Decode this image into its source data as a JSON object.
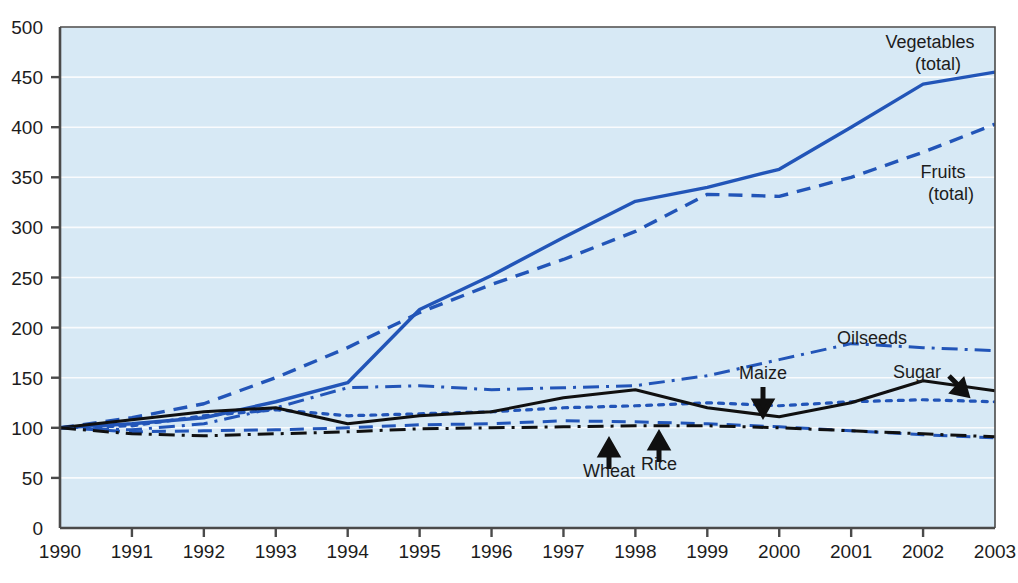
{
  "chart_data": {
    "type": "line",
    "title": "",
    "subtitle": "",
    "xlabel": "",
    "ylabel": "",
    "x": [
      1990,
      1991,
      1992,
      1993,
      1994,
      1995,
      1996,
      1997,
      1998,
      1999,
      2000,
      2001,
      2002,
      2003
    ],
    "xlim": [
      1990,
      2003
    ],
    "ylim": [
      0,
      500
    ],
    "ytick_values": [
      0,
      50,
      100,
      150,
      200,
      250,
      300,
      350,
      400,
      450,
      500
    ],
    "ytick_labels": [
      "0",
      "50",
      "100",
      "150",
      "200",
      "250",
      "300",
      "350",
      "400",
      "450",
      "500"
    ],
    "xtick_labels": [
      "1990",
      "1991",
      "1992",
      "1993",
      "1994",
      "1995",
      "1996",
      "1997",
      "1998",
      "1999",
      "2000",
      "2001",
      "2002",
      "2003"
    ],
    "grid": true,
    "grid_color": "#ffffff",
    "plot_background": "#d7e9f5",
    "legend_position": "inline-labels",
    "series": [
      {
        "name": "Vegetables (total)",
        "label": "Vegetables",
        "label_line2": "(total)",
        "style": "solid",
        "color": "#2255b8",
        "width": 3.4,
        "values": [
          100,
          104,
          110,
          126,
          145,
          218,
          252,
          290,
          326,
          340,
          358,
          400,
          443,
          455
        ]
      },
      {
        "name": "Fruits (total)",
        "label": "Fruits",
        "label_line2": "(total)",
        "style": "dashed",
        "color": "#2255b8",
        "width": 3.4,
        "values": [
          100,
          110,
          124,
          150,
          180,
          215,
          243,
          268,
          296,
          333,
          331,
          350,
          375,
          403
        ]
      },
      {
        "name": "Oilseeds",
        "label": "Oilseeds",
        "label_line2": "",
        "style": "dashdot",
        "color": "#2255b8",
        "width": 3.0,
        "values": [
          100,
          98,
          104,
          120,
          140,
          142,
          138,
          140,
          142,
          152,
          168,
          184,
          180,
          177
        ]
      },
      {
        "name": "Maize",
        "label": "Maize",
        "label_line2": "",
        "style": "dotted",
        "color": "#2255b8",
        "width": 3.2,
        "values": [
          100,
          102,
          112,
          118,
          112,
          114,
          116,
          120,
          122,
          125,
          122,
          126,
          128,
          126
        ]
      },
      {
        "name": "Sugar",
        "label": "Sugar",
        "label_line2": "",
        "style": "solid",
        "color": "#101010",
        "width": 3.0,
        "values": [
          100,
          108,
          116,
          120,
          104,
          112,
          116,
          130,
          138,
          120,
          111,
          125,
          147,
          137
        ]
      },
      {
        "name": "Wheat",
        "label": "Wheat",
        "label_line2": "",
        "style": "dashed",
        "color": "#2255b8",
        "width": 3.0,
        "values": [
          100,
          96,
          97,
          98,
          100,
          103,
          104,
          107,
          106,
          104,
          101,
          97,
          93,
          90
        ]
      },
      {
        "name": "Rice",
        "label": "Rice",
        "label_line2": "",
        "style": "dashdot",
        "color": "#101010",
        "width": 3.0,
        "values": [
          100,
          94,
          92,
          94,
          96,
          99,
          100,
          101,
          102,
          102,
          100,
          97,
          94,
          91
        ]
      }
    ],
    "annotations": [
      {
        "text": "Vegetables",
        "text2": "(total)",
        "x": 930,
        "y": 48,
        "anchor": "middle",
        "arrow": "none"
      },
      {
        "text": "Fruits",
        "text2": "(total)",
        "x": 943,
        "y": 178,
        "anchor": "middle",
        "arrow": "none"
      },
      {
        "text": "Oilseeds",
        "text2": "",
        "x": 872,
        "y": 344,
        "anchor": "middle",
        "arrow": "none"
      },
      {
        "text": "Sugar",
        "text2": "",
        "x": 917,
        "y": 378,
        "anchor": "middle",
        "arrow": "down-right"
      },
      {
        "text": "Maize",
        "text2": "",
        "x": 763,
        "y": 379,
        "anchor": "middle",
        "arrow": "down"
      },
      {
        "text": "Wheat",
        "text2": "",
        "x": 609,
        "y": 477,
        "anchor": "middle",
        "arrow": "up"
      },
      {
        "text": "Rice",
        "text2": "",
        "x": 659,
        "y": 470,
        "anchor": "middle",
        "arrow": "up"
      }
    ]
  },
  "axes": {
    "frame_color": "#4a4a4a"
  }
}
